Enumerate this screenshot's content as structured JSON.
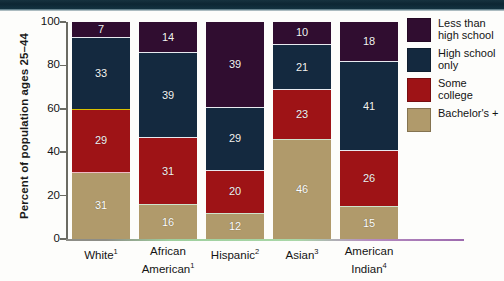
{
  "chart_data": {
    "type": "bar",
    "subtype": "stacked-bar-100",
    "title": "",
    "xlabel": "",
    "ylabel": "Percent of population ages 25–44",
    "ylim": [
      0,
      100
    ],
    "yticks": [
      0,
      20,
      40,
      60,
      80,
      100
    ],
    "grid": false,
    "legend_position": "right",
    "categories": [
      "White¹",
      "African American¹",
      "Hispanic²",
      "Asian³",
      "American Indian⁴"
    ],
    "category_lines": [
      [
        "White",
        "1"
      ],
      [
        "African",
        "American",
        "1"
      ],
      [
        "Hispanic",
        "2"
      ],
      [
        "Asian",
        "3"
      ],
      [
        "American",
        "Indian",
        "4"
      ]
    ],
    "series": [
      {
        "name": "Bachelor's +",
        "color": "#b09a6b",
        "values": [
          31,
          16,
          12,
          46,
          15
        ]
      },
      {
        "name": "Some college",
        "color": "#9e1316",
        "values": [
          29,
          31,
          20,
          23,
          26
        ]
      },
      {
        "name": "High school only",
        "color": "#14293f",
        "values": [
          33,
          39,
          29,
          21,
          41
        ]
      },
      {
        "name": "Less than high school",
        "color": "#300d30",
        "values": [
          7,
          14,
          39,
          10,
          18
        ]
      }
    ]
  },
  "legend": {
    "items": [
      {
        "label_line1": "Less than",
        "label_line2": "high school",
        "color": "#300d30"
      },
      {
        "label_line1": "High school",
        "label_line2": "only",
        "color": "#14293f"
      },
      {
        "label_line1": "Some college",
        "label_line2": "",
        "color": "#9e1316"
      },
      {
        "label_line1": "Bachelor's +",
        "label_line2": "",
        "color": "#b09a6b"
      }
    ]
  },
  "axis": {
    "y_title": "Percent of population ages 25–44",
    "y_tick_labels": [
      "100",
      "80",
      "60",
      "40",
      "20",
      "0"
    ]
  },
  "colors": {
    "less_than_high_school": "#300d30",
    "high_school_only": "#14293f",
    "some_college": "#9e1316",
    "bachelors_plus": "#b09a6b",
    "page_background": "#fdfdfb",
    "top_band": "#0d2633",
    "axis": "#6b6b63"
  }
}
